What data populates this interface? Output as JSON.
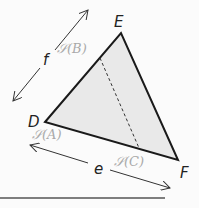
{
  "diagram": {
    "triangle": {
      "vertices": [
        {
          "name": "D",
          "x": 45,
          "y": 122
        },
        {
          "name": "E",
          "x": 121,
          "y": 33
        },
        {
          "name": "F",
          "x": 178,
          "y": 160
        }
      ],
      "fill": "#e9e9e9",
      "stroke": "#1a1a1a"
    },
    "labels": {
      "D": "D",
      "E": "E",
      "F": "F",
      "e": "e",
      "f": "f",
      "SA": "𝒮(A)",
      "SB": "𝒮(B)",
      "SC": "𝒮(C)"
    },
    "dimension_arrows": [
      {
        "name": "f",
        "from": [
          13,
          101
        ],
        "to": [
          88,
          10
        ]
      },
      {
        "name": "e",
        "from": [
          30,
          145
        ],
        "to": [
          170,
          188
        ]
      }
    ],
    "dashed_segment": {
      "from": [
        100,
        58
      ],
      "to": [
        139,
        148
      ]
    },
    "baseline": {
      "from": [
        0,
        198
      ],
      "to": [
        165,
        198
      ],
      "color": "#555555"
    }
  }
}
